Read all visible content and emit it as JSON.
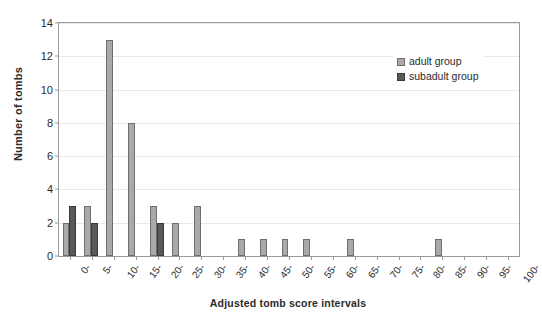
{
  "chart_data": {
    "type": "bar",
    "title": "",
    "xlabel": "Adjusted tomb score intervals",
    "ylabel": "Number of tombs",
    "categories": [
      "0-",
      "5-",
      "10-",
      "15-",
      "20-",
      "25-",
      "30-",
      "35-",
      "40-",
      "45-",
      "50-",
      "55-",
      "60-",
      "65-",
      "70-",
      "75-",
      "80-",
      "85-",
      "90-",
      "95-",
      "100-"
    ],
    "series": [
      {
        "name": "adult group",
        "color": "#a9a9a9",
        "values": [
          2,
          3,
          13,
          8,
          3,
          2,
          3,
          0,
          1,
          1,
          1,
          1,
          0,
          1,
          0,
          0,
          0,
          1,
          0,
          0,
          0
        ]
      },
      {
        "name": "subadult group",
        "color": "#595959",
        "values": [
          3,
          2,
          0,
          0,
          2,
          0,
          0,
          0,
          0,
          0,
          0,
          0,
          0,
          0,
          0,
          0,
          0,
          0,
          0,
          0,
          0
        ]
      }
    ],
    "ylim": [
      0,
      14
    ],
    "yticks": [
      0,
      2,
      4,
      6,
      8,
      10,
      12,
      14
    ],
    "grid": true,
    "legend_position": "top-right"
  },
  "legend": {
    "items": [
      {
        "label": "adult group"
      },
      {
        "label": "subadult group"
      }
    ]
  }
}
